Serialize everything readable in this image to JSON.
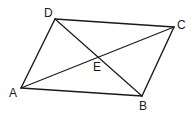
{
  "figure": {
    "shape": "parallelogram",
    "vertices": {
      "A": {
        "label": "A",
        "x": 21,
        "y": 88,
        "label_x": 9,
        "label_y": 97
      },
      "B": {
        "label": "B",
        "x": 142,
        "y": 96,
        "label_x": 139,
        "label_y": 110
      },
      "C": {
        "label": "C",
        "x": 174,
        "y": 27,
        "label_x": 177,
        "label_y": 29
      },
      "D": {
        "label": "D",
        "x": 55,
        "y": 19,
        "label_x": 44,
        "label_y": 17
      }
    },
    "intersection": {
      "label": "E",
      "x": 97,
      "y": 57,
      "label_x": 93,
      "label_y": 71
    },
    "sides": [
      "AB",
      "BC",
      "CD",
      "DA"
    ],
    "diagonals": [
      "AC",
      "BD"
    ],
    "stroke_color": "#1a1a1a"
  }
}
